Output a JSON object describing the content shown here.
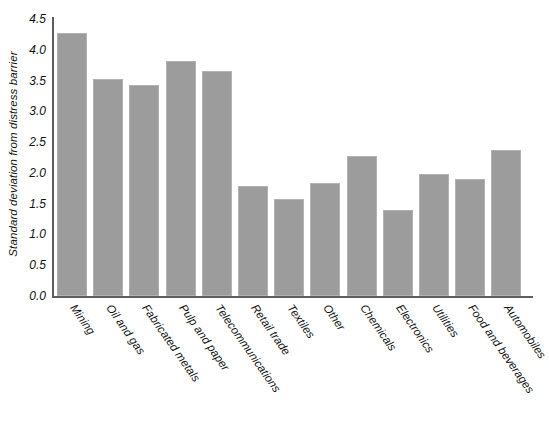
{
  "chart_data": {
    "type": "bar",
    "title": "",
    "xlabel": "",
    "ylabel": "Standard deviation from distress barrier",
    "ylim": [
      0.0,
      4.5
    ],
    "ytick_labels": [
      "0.0",
      "0.5",
      "1.0",
      "1.5",
      "2.0",
      "2.5",
      "3.0",
      "3.5",
      "4.0",
      "4.5"
    ],
    "ytick_values": [
      0.0,
      0.5,
      1.0,
      1.5,
      2.0,
      2.5,
      3.0,
      3.5,
      4.0,
      4.5
    ],
    "grid": false,
    "legend": "none",
    "bar_color": "#9c9c9c",
    "categories": [
      "Mining",
      "Oil and gas",
      "Fabricated metals",
      "Pulp and paper",
      "Telecommunications",
      "Retail trade",
      "Textiles",
      "Other",
      "Chemicals",
      "Electronics",
      "Utilities",
      "Food and beverages",
      "Automobiles"
    ],
    "values": [
      4.27,
      3.53,
      3.43,
      3.81,
      3.66,
      1.78,
      1.57,
      1.84,
      2.28,
      1.4,
      1.98,
      1.9,
      2.37
    ]
  }
}
